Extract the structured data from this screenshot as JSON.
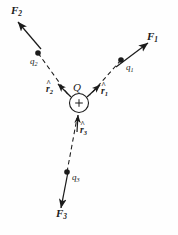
{
  "figure": {
    "width": 178,
    "height": 235,
    "background_color": "#fefefe",
    "ink_color": "#1b1b1b"
  },
  "central_charge": {
    "label": "Q",
    "sign_glyph": "+",
    "center_x": 79,
    "center_y": 103,
    "radius": 10
  },
  "forces": [
    {
      "name": "F1",
      "label_base": "F",
      "label_sub": "1",
      "label_x": 147,
      "label_y": 32,
      "tail_x": 116,
      "tail_y": 67,
      "tip_x": 147,
      "tip_y": 44,
      "style": "solid"
    },
    {
      "name": "F2",
      "label_base": "F",
      "label_sub": "2",
      "label_x": 11,
      "label_y": 6,
      "tail_x": 41,
      "tail_y": 49,
      "tip_x": 18,
      "tip_y": 22,
      "style": "solid"
    },
    {
      "name": "F3",
      "label_base": "F",
      "label_sub": "3",
      "label_x": 56,
      "label_y": 209,
      "tail_x": 68,
      "tail_y": 172,
      "tip_x": 61,
      "tip_y": 208,
      "style": "solid"
    }
  ],
  "charges": [
    {
      "name": "q1",
      "label_base": "q",
      "label_sub": "1",
      "dot_x": 121,
      "dot_y": 60,
      "label_x": 126,
      "label_y": 64
    },
    {
      "name": "q2",
      "label_base": "q",
      "label_sub": "2",
      "dot_x": 38,
      "dot_y": 53,
      "label_x": 30,
      "label_y": 58
    },
    {
      "name": "q3",
      "label_base": "q",
      "label_sub": "3",
      "dot_x": 67,
      "dot_y": 172,
      "label_x": 72,
      "label_y": 174
    }
  ],
  "unit_vectors": [
    {
      "name": "r1-hat",
      "label_base": "r",
      "label_sub": "1",
      "label_x": 100,
      "label_y": 88,
      "tail_x": 88,
      "tail_y": 97,
      "tip_x": 99,
      "tip_y": 86
    },
    {
      "name": "r2-hat",
      "label_base": "r",
      "label_sub": "2",
      "label_x": 47,
      "label_y": 86,
      "tail_x": 70,
      "tail_y": 97,
      "tip_x": 58,
      "tip_y": 85
    },
    {
      "name": "r3-hat",
      "label_base": "r",
      "label_sub": "3",
      "label_x": 80,
      "label_y": 127,
      "tail_x": 76,
      "tail_y": 131,
      "tip_x": 78,
      "tip_y": 116
    }
  ],
  "connector_lines": [
    {
      "name": "dashed-q1-to-Q",
      "style": "dashed",
      "x1": 121,
      "y1": 60,
      "x2": 90,
      "y2": 95
    },
    {
      "name": "dashed-q2-to-Q",
      "style": "dashed",
      "x1": 38,
      "y1": 53,
      "x2": 69,
      "y2": 96
    },
    {
      "name": "dashed-q3-to-Q",
      "style": "dashed",
      "x1": 67,
      "y1": 172,
      "x2": 77,
      "y2": 118
    }
  ]
}
